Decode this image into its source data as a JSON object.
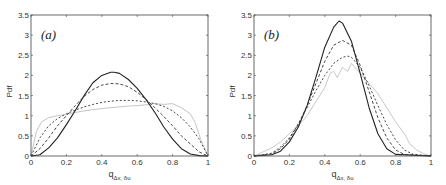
{
  "chart_data": [
    {
      "type": "line",
      "panel_label": "(a)",
      "xlabel": "q_{Δx, δu}",
      "ylabel": "Pdf",
      "xlim": [
        0,
        1
      ],
      "ylim": [
        0,
        3.5
      ],
      "xticks": [
        "0",
        "0.2",
        "0.4",
        "0.6",
        "0.8",
        "1"
      ],
      "yticks": [
        "0",
        "0.5",
        "1",
        "1.5",
        "2",
        "2.5",
        "3",
        "3.5"
      ],
      "grid": false,
      "legend": null,
      "series": [
        {
          "name": "solid",
          "style": "solid",
          "color": "#222222",
          "x": [
            0,
            0.05,
            0.1,
            0.15,
            0.2,
            0.25,
            0.3,
            0.35,
            0.4,
            0.45,
            0.47,
            0.5,
            0.55,
            0.6,
            0.65,
            0.7,
            0.75,
            0.8,
            0.85,
            0.9,
            0.95,
            1
          ],
          "y": [
            0,
            0.03,
            0.2,
            0.45,
            0.78,
            1.13,
            1.5,
            1.82,
            2.0,
            2.08,
            2.08,
            2.05,
            1.9,
            1.68,
            1.4,
            1.08,
            0.72,
            0.42,
            0.18,
            0.05,
            0.01,
            0
          ]
        },
        {
          "name": "dashed-1",
          "style": "dashed",
          "color": "#333333",
          "x": [
            0,
            0.05,
            0.1,
            0.15,
            0.2,
            0.25,
            0.3,
            0.35,
            0.4,
            0.45,
            0.5,
            0.55,
            0.6,
            0.65,
            0.7,
            0.75,
            0.8,
            0.85,
            0.9,
            0.95,
            1
          ],
          "y": [
            0,
            0.18,
            0.45,
            0.75,
            1.0,
            1.25,
            1.48,
            1.65,
            1.76,
            1.8,
            1.79,
            1.72,
            1.58,
            1.4,
            1.2,
            0.98,
            0.75,
            0.5,
            0.3,
            0.1,
            0
          ]
        },
        {
          "name": "dashed-2",
          "style": "dashed",
          "color": "#333333",
          "x": [
            0,
            0.05,
            0.1,
            0.15,
            0.2,
            0.25,
            0.3,
            0.35,
            0.4,
            0.45,
            0.5,
            0.55,
            0.6,
            0.65,
            0.7,
            0.75,
            0.8,
            0.85,
            0.9,
            0.95,
            1
          ],
          "y": [
            0,
            0.45,
            0.75,
            0.93,
            1.05,
            1.14,
            1.22,
            1.28,
            1.33,
            1.36,
            1.38,
            1.38,
            1.37,
            1.34,
            1.3,
            1.23,
            1.12,
            0.95,
            0.72,
            0.42,
            0
          ]
        },
        {
          "name": "data",
          "style": "solid",
          "color": "#bdbdbd",
          "x": [
            0,
            0.03,
            0.06,
            0.1,
            0.15,
            0.2,
            0.25,
            0.3,
            0.35,
            0.4,
            0.45,
            0.5,
            0.55,
            0.6,
            0.65,
            0.7,
            0.75,
            0.8,
            0.85,
            0.9,
            0.93,
            0.96,
            1
          ],
          "y": [
            0,
            0.6,
            0.85,
            0.95,
            1.0,
            1.03,
            1.08,
            1.12,
            1.15,
            1.18,
            1.2,
            1.22,
            1.24,
            1.25,
            1.27,
            1.3,
            1.28,
            1.3,
            1.2,
            1.05,
            0.8,
            0.4,
            0
          ]
        }
      ]
    },
    {
      "type": "line",
      "panel_label": "(b)",
      "xlabel": "q_{Δx, δu}",
      "ylabel": "Pdf",
      "xlim": [
        0,
        1
      ],
      "ylim": [
        0,
        3.5
      ],
      "xticks": [
        "0",
        "0.2",
        "0.4",
        "0.6",
        "0.8",
        "1"
      ],
      "yticks": [
        "0",
        "0.5",
        "1",
        "1.5",
        "2",
        "2.5",
        "3",
        "3.5"
      ],
      "grid": false,
      "legend": null,
      "series": [
        {
          "name": "solid",
          "style": "solid",
          "color": "#222222",
          "x": [
            0,
            0.1,
            0.15,
            0.2,
            0.25,
            0.3,
            0.35,
            0.4,
            0.45,
            0.48,
            0.5,
            0.55,
            0.6,
            0.65,
            0.7,
            0.75,
            0.8,
            1
          ],
          "y": [
            0,
            0.03,
            0.12,
            0.35,
            0.72,
            1.25,
            1.95,
            2.7,
            3.2,
            3.35,
            3.3,
            2.85,
            2.05,
            1.2,
            0.55,
            0.18,
            0.04,
            0
          ]
        },
        {
          "name": "dashed-1",
          "style": "dashed",
          "color": "#333333",
          "x": [
            0,
            0.1,
            0.15,
            0.2,
            0.25,
            0.3,
            0.35,
            0.4,
            0.45,
            0.5,
            0.55,
            0.6,
            0.65,
            0.7,
            0.75,
            0.8,
            0.85,
            1
          ],
          "y": [
            0,
            0.05,
            0.18,
            0.42,
            0.78,
            1.25,
            1.8,
            2.35,
            2.75,
            2.87,
            2.75,
            2.25,
            1.6,
            0.95,
            0.45,
            0.15,
            0.04,
            0
          ]
        },
        {
          "name": "dashed-2",
          "style": "dashed",
          "color": "#333333",
          "x": [
            0,
            0.1,
            0.15,
            0.2,
            0.25,
            0.3,
            0.35,
            0.4,
            0.45,
            0.5,
            0.53,
            0.55,
            0.6,
            0.65,
            0.7,
            0.75,
            0.8,
            0.85,
            0.9,
            1
          ],
          "y": [
            0,
            0.07,
            0.22,
            0.45,
            0.8,
            1.2,
            1.62,
            2.0,
            2.3,
            2.45,
            2.48,
            2.45,
            2.2,
            1.75,
            1.25,
            0.78,
            0.4,
            0.15,
            0.04,
            0
          ]
        },
        {
          "name": "data",
          "style": "solid",
          "color": "#c2c2c2",
          "x": [
            0,
            0.05,
            0.1,
            0.15,
            0.2,
            0.25,
            0.3,
            0.35,
            0.4,
            0.43,
            0.45,
            0.47,
            0.5,
            0.53,
            0.55,
            0.6,
            0.65,
            0.7,
            0.75,
            0.8,
            0.85,
            0.88,
            0.92,
            0.96,
            1
          ],
          "y": [
            0,
            0.1,
            0.2,
            0.35,
            0.55,
            0.75,
            1.0,
            1.35,
            1.7,
            2.05,
            2.1,
            1.95,
            2.2,
            2.1,
            2.3,
            2.05,
            1.8,
            1.55,
            1.2,
            0.85,
            0.55,
            0.3,
            0.15,
            0.05,
            0
          ]
        }
      ]
    }
  ]
}
